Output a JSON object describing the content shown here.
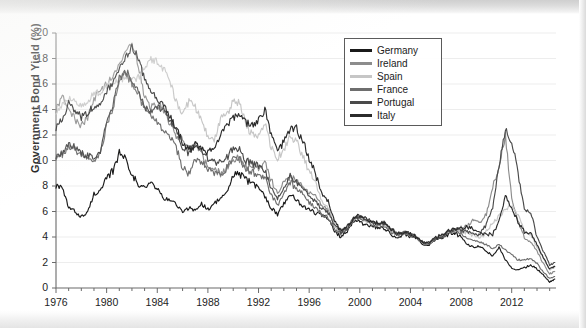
{
  "chart_data": {
    "type": "line",
    "title": "",
    "xlabel": "",
    "ylabel": "Government Bond Yield (%)",
    "xlim": [
      1976,
      2015.5
    ],
    "ylim": [
      0,
      20
    ],
    "ytick_labels": [
      "0",
      "2",
      "4",
      "6",
      "8",
      "10",
      "12",
      "14",
      "16",
      "18",
      "20"
    ],
    "xtick_labels": [
      "1976",
      "1980",
      "1984",
      "1988",
      "1992",
      "1996",
      "2000",
      "2004",
      "2008",
      "2012"
    ],
    "grid": true,
    "legend_position": "top-right",
    "series": [
      {
        "name": "Germany",
        "color": "#1a1a1a",
        "x": [
          1976.0,
          1976.5,
          1977.0,
          1977.5,
          1978.0,
          1978.5,
          1979.0,
          1979.5,
          1980.0,
          1980.5,
          1981.0,
          1981.5,
          1982.0,
          1982.5,
          1983.0,
          1983.5,
          1984.0,
          1984.5,
          1985.0,
          1985.5,
          1986.0,
          1986.5,
          1987.0,
          1987.5,
          1988.0,
          1988.5,
          1989.0,
          1989.5,
          1990.0,
          1990.5,
          1991.0,
          1991.5,
          1992.0,
          1992.5,
          1993.0,
          1993.5,
          1994.0,
          1994.5,
          1995.0,
          1995.5,
          1996.0,
          1996.5,
          1997.0,
          1997.5,
          1998.0,
          1998.5,
          1999.0,
          1999.5,
          2000.0,
          2000.5,
          2001.0,
          2001.5,
          2002.0,
          2002.5,
          2003.0,
          2003.5,
          2004.0,
          2004.5,
          2005.0,
          2005.5,
          2006.0,
          2006.5,
          2007.0,
          2007.5,
          2008.0,
          2008.5,
          2009.0,
          2009.5,
          2010.0,
          2010.5,
          2011.0,
          2011.5,
          2012.0,
          2012.5,
          2013.0,
          2013.5,
          2014.0,
          2014.5,
          2015.0,
          2015.4
        ],
        "y": [
          8.1,
          7.8,
          6.3,
          6.0,
          5.6,
          5.9,
          7.4,
          7.6,
          8.5,
          9.2,
          10.6,
          10.2,
          9.0,
          8.0,
          7.9,
          8.2,
          7.8,
          7.0,
          6.9,
          6.6,
          5.9,
          6.3,
          6.1,
          6.6,
          6.2,
          6.6,
          7.1,
          7.4,
          8.9,
          8.9,
          8.5,
          8.2,
          7.9,
          7.2,
          6.3,
          5.8,
          6.6,
          7.4,
          6.9,
          6.4,
          6.2,
          5.9,
          5.7,
          5.4,
          4.5,
          4.0,
          4.5,
          5.3,
          5.2,
          4.9,
          4.8,
          4.7,
          4.6,
          4.2,
          3.9,
          4.2,
          4.0,
          3.9,
          3.4,
          3.4,
          3.8,
          3.9,
          4.2,
          4.3,
          4.0,
          3.4,
          3.2,
          3.3,
          2.9,
          2.5,
          3.2,
          2.2,
          1.6,
          1.4,
          1.6,
          1.8,
          1.5,
          1.0,
          0.5,
          0.7
        ]
      },
      {
        "name": "Ireland",
        "color": "#8c8c8c",
        "x": [
          1976.0,
          1976.5,
          1977.0,
          1977.5,
          1978.0,
          1978.5,
          1979.0,
          1979.5,
          1980.0,
          1980.5,
          1981.0,
          1981.5,
          1982.0,
          1982.5,
          1983.0,
          1983.5,
          1984.0,
          1984.5,
          1985.0,
          1985.5,
          1986.0,
          1986.5,
          1987.0,
          1987.5,
          1988.0,
          1988.5,
          1989.0,
          1989.5,
          1990.0,
          1990.5,
          1991.0,
          1991.5,
          1992.0,
          1992.5,
          1993.0,
          1993.5,
          1994.0,
          1994.5,
          1995.0,
          1995.5,
          1996.0,
          1996.5,
          1997.0,
          1997.5,
          1998.0,
          1998.5,
          1999.0,
          1999.5,
          2000.0,
          2000.5,
          2001.0,
          2001.5,
          2002.0,
          2002.5,
          2003.0,
          2003.5,
          2004.0,
          2004.5,
          2005.0,
          2005.5,
          2006.0,
          2006.5,
          2007.0,
          2007.5,
          2008.0,
          2008.5,
          2009.0,
          2009.5,
          2010.0,
          2010.5,
          2011.0,
          2011.5,
          2012.0,
          2012.5,
          2013.0,
          2013.5,
          2014.0,
          2014.5,
          2015.0,
          2015.4
        ],
        "y": [
          14.0,
          15.0,
          14.2,
          13.2,
          12.8,
          13.4,
          14.8,
          15.5,
          16.0,
          16.8,
          17.6,
          18.6,
          19.2,
          17.5,
          15.0,
          14.2,
          14.4,
          14.0,
          12.9,
          12.0,
          11.6,
          11.2,
          11.4,
          10.5,
          9.4,
          9.3,
          9.0,
          9.4,
          10.2,
          10.1,
          9.6,
          9.3,
          9.4,
          9.9,
          8.4,
          7.4,
          8.2,
          8.7,
          8.3,
          8.0,
          7.5,
          7.2,
          6.5,
          6.2,
          5.0,
          4.5,
          4.7,
          5.4,
          5.6,
          5.3,
          5.1,
          5.0,
          5.0,
          4.5,
          4.2,
          4.4,
          4.2,
          4.0,
          3.5,
          3.5,
          4.0,
          4.1,
          4.4,
          4.6,
          4.7,
          4.9,
          5.4,
          5.2,
          5.8,
          7.8,
          9.6,
          12.0,
          7.0,
          5.3,
          3.9,
          3.6,
          2.9,
          1.9,
          1.1,
          1.3
        ]
      },
      {
        "name": "Spain",
        "color": "#c6c6c6",
        "x": [
          1976.0,
          1976.5,
          1977.0,
          1977.5,
          1978.0,
          1978.5,
          1979.0,
          1979.5,
          1980.0,
          1980.5,
          1981.0,
          1981.5,
          1982.0,
          1982.5,
          1983.0,
          1983.5,
          1984.0,
          1984.5,
          1985.0,
          1985.5,
          1986.0,
          1986.5,
          1987.0,
          1987.5,
          1988.0,
          1988.5,
          1989.0,
          1989.5,
          1990.0,
          1990.5,
          1991.0,
          1991.5,
          1992.0,
          1992.5,
          1993.0,
          1993.5,
          1994.0,
          1994.5,
          1995.0,
          1995.5,
          1996.0,
          1996.5,
          1997.0,
          1997.5,
          1998.0,
          1998.5,
          1999.0,
          1999.5,
          2000.0,
          2000.5,
          2001.0,
          2001.5,
          2002.0,
          2002.5,
          2003.0,
          2003.5,
          2004.0,
          2004.5,
          2005.0,
          2005.5,
          2006.0,
          2006.5,
          2007.0,
          2007.5,
          2008.0,
          2008.5,
          2009.0,
          2009.5,
          2010.0,
          2010.5,
          2011.0,
          2011.5,
          2012.0,
          2012.5,
          2013.0,
          2013.5,
          2014.0,
          2014.5,
          2015.0,
          2015.4
        ],
        "y": [
          13.9,
          14.3,
          14.9,
          14.5,
          14.2,
          14.6,
          15.3,
          15.4,
          15.9,
          16.2,
          16.3,
          16.6,
          16.2,
          16.5,
          17.4,
          18.0,
          17.7,
          17.2,
          16.3,
          14.6,
          13.8,
          14.6,
          14.2,
          13.0,
          12.0,
          11.6,
          13.3,
          13.5,
          14.7,
          14.5,
          12.8,
          12.0,
          11.9,
          13.0,
          11.0,
          10.2,
          10.8,
          11.9,
          11.5,
          10.3,
          9.2,
          8.3,
          6.8,
          6.3,
          4.9,
          4.3,
          4.7,
          5.5,
          5.6,
          5.3,
          5.1,
          5.0,
          5.0,
          4.5,
          4.2,
          4.3,
          4.2,
          4.0,
          3.5,
          3.5,
          3.9,
          4.0,
          4.4,
          4.5,
          4.4,
          4.3,
          4.1,
          3.9,
          4.4,
          5.1,
          5.6,
          6.2,
          6.5,
          5.7,
          4.6,
          4.2,
          3.2,
          2.3,
          1.4,
          1.6
        ]
      },
      {
        "name": "France",
        "color": "#6e6e6e",
        "x": [
          1976.0,
          1976.5,
          1977.0,
          1977.5,
          1978.0,
          1978.5,
          1979.0,
          1979.5,
          1980.0,
          1980.5,
          1981.0,
          1981.5,
          1982.0,
          1982.5,
          1983.0,
          1983.5,
          1984.0,
          1984.5,
          1985.0,
          1985.5,
          1986.0,
          1986.5,
          1987.0,
          1987.5,
          1988.0,
          1988.5,
          1989.0,
          1989.5,
          1990.0,
          1990.5,
          1991.0,
          1991.5,
          1992.0,
          1992.5,
          1993.0,
          1993.5,
          1994.0,
          1994.5,
          1995.0,
          1995.5,
          1996.0,
          1996.5,
          1997.0,
          1997.5,
          1998.0,
          1998.5,
          1999.0,
          1999.5,
          2000.0,
          2000.5,
          2001.0,
          2001.5,
          2002.0,
          2002.5,
          2003.0,
          2003.5,
          2004.0,
          2004.5,
          2005.0,
          2005.5,
          2006.0,
          2006.5,
          2007.0,
          2007.5,
          2008.0,
          2008.5,
          2009.0,
          2009.5,
          2010.0,
          2010.5,
          2011.0,
          2011.5,
          2012.0,
          2012.5,
          2013.0,
          2013.5,
          2014.0,
          2014.5,
          2015.0,
          2015.4
        ],
        "y": [
          10.3,
          10.5,
          11.0,
          10.8,
          10.4,
          10.2,
          10.0,
          10.4,
          12.8,
          14.2,
          16.2,
          16.9,
          16.0,
          15.2,
          14.0,
          13.6,
          13.0,
          12.4,
          11.8,
          11.0,
          9.4,
          9.0,
          10.0,
          9.8,
          9.3,
          9.1,
          9.0,
          9.4,
          10.3,
          10.2,
          9.3,
          9.1,
          8.9,
          8.6,
          7.3,
          6.5,
          7.4,
          8.3,
          7.8,
          7.4,
          6.7,
          6.3,
          5.8,
          5.5,
          4.7,
          4.2,
          4.6,
          5.4,
          5.5,
          5.3,
          5.0,
          4.9,
          4.9,
          4.4,
          4.1,
          4.3,
          4.1,
          3.9,
          3.5,
          3.5,
          3.9,
          4.0,
          4.4,
          4.5,
          4.3,
          3.9,
          3.7,
          3.6,
          3.4,
          3.1,
          3.4,
          3.0,
          2.6,
          2.2,
          2.2,
          2.3,
          1.9,
          1.3,
          0.7,
          0.9
        ]
      },
      {
        "name": "Portugal",
        "color": "#4a4a4a",
        "x": [
          1976.0,
          1976.5,
          1977.0,
          1977.5,
          1978.0,
          1978.5,
          1979.0,
          1979.5,
          1980.0,
          1980.5,
          1981.0,
          1981.5,
          1982.0,
          1982.5,
          1983.0,
          1983.5,
          1984.0,
          1984.5,
          1985.0,
          1985.5,
          1986.0,
          1986.5,
          1987.0,
          1987.5,
          1988.0,
          1988.5,
          1989.0,
          1989.5,
          1990.0,
          1990.5,
          1991.0,
          1991.5,
          1992.0,
          1992.5,
          1993.0,
          1993.5,
          1994.0,
          1994.5,
          1995.0,
          1995.5,
          1996.0,
          1996.5,
          1997.0,
          1997.5,
          1998.0,
          1998.5,
          1999.0,
          1999.5,
          2000.0,
          2000.5,
          2001.0,
          2001.5,
          2002.0,
          2002.5,
          2003.0,
          2003.5,
          2004.0,
          2004.5,
          2005.0,
          2005.5,
          2006.0,
          2006.5,
          2007.0,
          2007.5,
          2008.0,
          2008.5,
          2009.0,
          2009.5,
          2010.0,
          2010.5,
          2011.0,
          2011.5,
          2012.0,
          2012.5,
          2013.0,
          2013.5,
          2014.0,
          2014.5,
          2015.0,
          2015.4
        ],
        "y": [
          10.4,
          10.6,
          11.2,
          11.0,
          10.6,
          10.4,
          10.2,
          10.6,
          13.0,
          14.4,
          16.4,
          17.1,
          16.2,
          15.4,
          14.1,
          13.8,
          14.2,
          13.9,
          13.2,
          12.4,
          11.0,
          10.6,
          11.2,
          10.8,
          10.2,
          9.9,
          9.8,
          10.2,
          11.0,
          10.8,
          10.0,
          9.8,
          9.6,
          9.2,
          7.9,
          7.0,
          7.9,
          8.8,
          8.3,
          7.9,
          7.2,
          6.8,
          6.2,
          5.9,
          5.0,
          4.4,
          4.7,
          5.5,
          5.6,
          5.4,
          5.2,
          5.0,
          5.1,
          4.6,
          4.2,
          4.4,
          4.2,
          4.0,
          3.5,
          3.5,
          3.9,
          4.1,
          4.4,
          4.6,
          4.5,
          4.4,
          4.3,
          4.2,
          5.0,
          6.3,
          9.6,
          12.5,
          11.5,
          9.0,
          6.2,
          6.0,
          4.0,
          2.9,
          1.8,
          2.0
        ]
      },
      {
        "name": "Italy",
        "color": "#2b2b2b",
        "x": [
          1976.0,
          1976.5,
          1977.0,
          1977.5,
          1978.0,
          1978.5,
          1979.0,
          1979.5,
          1980.0,
          1980.5,
          1981.0,
          1981.5,
          1982.0,
          1982.5,
          1983.0,
          1983.5,
          1984.0,
          1984.5,
          1985.0,
          1985.5,
          1986.0,
          1986.5,
          1987.0,
          1987.5,
          1988.0,
          1988.5,
          1989.0,
          1989.5,
          1990.0,
          1990.5,
          1991.0,
          1991.5,
          1992.0,
          1992.5,
          1993.0,
          1993.5,
          1994.0,
          1994.5,
          1995.0,
          1995.5,
          1996.0,
          1996.5,
          1997.0,
          1997.5,
          1998.0,
          1998.5,
          1999.0,
          1999.5,
          2000.0,
          2000.5,
          2001.0,
          2001.5,
          2002.0,
          2002.5,
          2003.0,
          2003.5,
          2004.0,
          2004.5,
          2005.0,
          2005.5,
          2006.0,
          2006.5,
          2007.0,
          2007.5,
          2008.0,
          2008.5,
          2009.0,
          2009.5,
          2010.0,
          2010.5,
          2011.0,
          2011.5,
          2012.0,
          2012.5,
          2013.0,
          2013.5,
          2014.0,
          2014.5,
          2015.0,
          2015.4
        ],
        "y": [
          12.6,
          13.2,
          14.6,
          14.0,
          13.4,
          13.8,
          14.2,
          14.6,
          15.4,
          16.2,
          17.2,
          18.0,
          19.0,
          18.0,
          16.4,
          15.4,
          14.9,
          14.2,
          13.4,
          12.6,
          11.4,
          10.8,
          11.2,
          10.8,
          10.6,
          10.9,
          12.0,
          12.6,
          13.4,
          13.6,
          13.0,
          12.8,
          13.2,
          14.0,
          12.0,
          10.6,
          11.5,
          12.4,
          12.5,
          11.5,
          10.2,
          9.0,
          7.4,
          6.8,
          5.2,
          4.5,
          4.8,
          5.5,
          5.7,
          5.4,
          5.2,
          5.1,
          5.1,
          4.6,
          4.3,
          4.4,
          4.3,
          4.0,
          3.6,
          3.6,
          4.0,
          4.1,
          4.5,
          4.6,
          4.7,
          4.8,
          4.6,
          4.3,
          4.2,
          4.2,
          5.2,
          7.2,
          6.2,
          5.2,
          4.4,
          4.3,
          3.4,
          2.4,
          1.5,
          1.7
        ]
      }
    ]
  },
  "legend": {
    "items": [
      {
        "label": "Germany",
        "color": "#1a1a1a"
      },
      {
        "label": "Ireland",
        "color": "#8c8c8c"
      },
      {
        "label": "Spain",
        "color": "#c6c6c6"
      },
      {
        "label": "France",
        "color": "#6e6e6e"
      },
      {
        "label": "Portugal",
        "color": "#4a4a4a"
      },
      {
        "label": "Italy",
        "color": "#2b2b2b"
      }
    ]
  }
}
